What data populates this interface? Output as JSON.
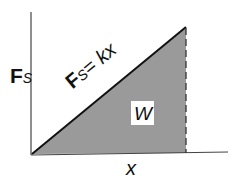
{
  "diagram": {
    "y_axis": {
      "label": "F",
      "label_sub": "S"
    },
    "x_axis": {
      "label": "x"
    },
    "line": {
      "label_main": "F",
      "label_sub": "S",
      "label_rest": "= kx"
    },
    "area": {
      "label": "W",
      "fill": "#9a9a9a"
    },
    "colors": {
      "axis": "#333333",
      "line": "#111111",
      "fill": "#9a9a9a",
      "background": "#ffffff"
    }
  }
}
